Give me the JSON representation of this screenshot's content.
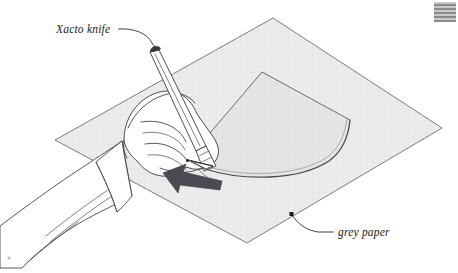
{
  "figure": {
    "background_color": "#ffffff",
    "width": 458,
    "height": 273
  },
  "labels": [
    {
      "id": "xacto-knife",
      "text": "Xacto knife",
      "x": 56,
      "y": 33,
      "points_to": "knife handle end",
      "leader": "curved"
    },
    {
      "id": "grey-paper",
      "text": "grey paper",
      "x": 340,
      "y": 235,
      "points_to": "paper lower-right edge",
      "leader": "curved"
    }
  ],
  "objects": {
    "paper": {
      "name": "grey paper",
      "shape": "parallelogram",
      "fill_color": "#ececec",
      "edge_color": "#6e6e72",
      "corners": [
        [
          273,
          18
        ],
        [
          442,
          128
        ],
        [
          247,
          243
        ],
        [
          55,
          140
        ]
      ]
    },
    "cut_shape": {
      "name": "curved wedge",
      "description": "fan / cone gore with pointed apex and curved arc base",
      "apex": [
        186,
        160
      ],
      "peak": [
        262,
        72
      ],
      "right_corner": [
        349,
        119
      ],
      "arc_end": [
        330,
        155
      ],
      "fill_color": "#e4e4e4"
    },
    "knife": {
      "name": "xacto knife",
      "body_color": "#ffffff",
      "outline_color": "#3a3a3a",
      "tip": [
        188,
        160
      ],
      "butt": [
        152,
        53
      ]
    },
    "hand": {
      "name": "hand gripping knife",
      "fill_color": "#ffffff",
      "outline_color": "#3a3a3a"
    },
    "sleeve": {
      "name": "shirt sleeve with cuff",
      "fill_color": "#ffffff",
      "outline_color": "#3a3a3a"
    },
    "direction_arrow": {
      "name": "cut direction arrow",
      "fill_color": "#4a4a52",
      "direction": "left",
      "tip": [
        163,
        174
      ],
      "tail": [
        222,
        188
      ]
    },
    "anchor_dot": {
      "name": "grey paper leader anchor dot",
      "x": 292,
      "y": 214,
      "color": "#1a1a1a"
    },
    "corner_swatch": {
      "name": "striped corner marker",
      "x": 434,
      "y": 2,
      "width": 22,
      "height": 20,
      "stripe_dark": "#8a8a8a",
      "stripe_light": "#c9c9c9"
    },
    "speck": {
      "name": "scan speck artifact",
      "x": 9,
      "y": 258,
      "color": "#bfbfbf"
    }
  }
}
